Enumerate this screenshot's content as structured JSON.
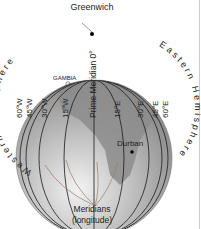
{
  "diagram": {
    "title_top": "Greenwich",
    "western_hemisphere": "Western Hemisphere",
    "eastern_hemisphere": "Eastern Hemisphere",
    "prime_meridian": "Prime Meridian 0°",
    "place_gambia": "GAMBIA",
    "place_durban": "Durban",
    "caption_line1": "Meridians",
    "caption_line2": "(longitude)",
    "west_meridians": [
      "60°W",
      "45°W",
      "30°W",
      "15°W"
    ],
    "east_meridians": [
      "15°E",
      "30°E",
      "45°E",
      "60°E"
    ],
    "colors": {
      "globe_ocean": "#b8b8b8",
      "globe_land": "#8f8f8f",
      "globe_light": "#e2e2e2",
      "lines": "#1a1a1a",
      "arrows": "#9a7a6a"
    }
  }
}
